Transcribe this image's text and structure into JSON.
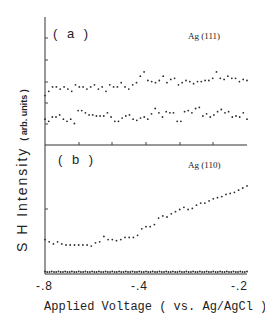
{
  "chart_data": [
    {
      "panel": "(a)",
      "annotation": "Ag (111)",
      "type": "scatter",
      "xlabel": "Applied Voltage ( vs. Ag/AgCl )",
      "ylabel": "SH Intensity ( arb. units )",
      "xlim": [
        -0.8,
        -0.2
      ],
      "x_ticks": [
        -0.8,
        -0.4,
        -0.2
      ],
      "series": [
        {
          "name": "upper",
          "x": [
            -0.8,
            -0.79,
            -0.78,
            -0.77,
            -0.76,
            -0.75,
            -0.74,
            -0.73,
            -0.72,
            -0.71,
            -0.7,
            -0.69,
            -0.68,
            -0.67,
            -0.66,
            -0.65,
            -0.64,
            -0.63,
            -0.62,
            -0.61,
            -0.6,
            -0.59,
            -0.58,
            -0.57,
            -0.56,
            -0.55,
            -0.54,
            -0.53,
            -0.52,
            -0.51,
            -0.5,
            -0.49,
            -0.48,
            -0.47,
            -0.46,
            -0.45,
            -0.44,
            -0.43,
            -0.42,
            -0.41,
            -0.4,
            -0.39,
            -0.38,
            -0.37,
            -0.36,
            -0.35,
            -0.34,
            -0.33,
            -0.32,
            -0.31,
            -0.3,
            -0.29,
            -0.28,
            -0.27,
            -0.26,
            -0.25,
            -0.24,
            -0.23,
            -0.22,
            -0.21,
            -0.2
          ],
          "y": [
            2.3,
            2.5,
            2.7,
            2.7,
            2.6,
            2.7,
            2.6,
            2.5,
            2.8,
            2.7,
            2.7,
            2.6,
            2.7,
            2.8,
            2.6,
            2.7,
            2.5,
            2.8,
            2.7,
            2.7,
            2.9,
            2.7,
            2.6,
            2.8,
            2.9,
            3.2,
            3.4,
            3.0,
            2.95,
            2.9,
            3.0,
            3.2,
            2.9,
            3.05,
            3.1,
            2.8,
            2.9,
            3.0,
            2.95,
            2.85,
            2.95,
            2.95,
            3.0,
            3.0,
            3.1,
            3.4,
            3.1,
            3.05,
            3.2,
            3.1,
            3.1,
            2.95,
            3.05,
            3.0
          ]
        },
        {
          "name": "lower",
          "x": [
            -0.8,
            -0.79,
            -0.78,
            -0.77,
            -0.76,
            -0.75,
            -0.74,
            -0.73,
            -0.72,
            -0.71,
            -0.7,
            -0.69,
            -0.68,
            -0.67,
            -0.66,
            -0.65,
            -0.64,
            -0.63,
            -0.62,
            -0.61,
            -0.6,
            -0.59,
            -0.58,
            -0.57,
            -0.56,
            -0.55,
            -0.54,
            -0.53,
            -0.52,
            -0.51,
            -0.5,
            -0.49,
            -0.48,
            -0.47,
            -0.46,
            -0.45,
            -0.44,
            -0.43,
            -0.42,
            -0.41,
            -0.4,
            -0.39,
            -0.38,
            -0.37,
            -0.36,
            -0.35,
            -0.34,
            -0.33,
            -0.32,
            -0.31,
            -0.3,
            -0.29,
            -0.28,
            -0.27,
            -0.26,
            -0.25,
            -0.24,
            -0.23,
            -0.22,
            -0.21,
            -0.2
          ],
          "y": [
            1.2,
            1.1,
            1.3,
            1.3,
            1.4,
            1.2,
            1.1,
            1.2,
            1.0,
            1.6,
            1.6,
            1.5,
            1.4,
            1.4,
            1.35,
            1.35,
            1.35,
            1.5,
            1.3,
            1.1,
            1.1,
            1.25,
            1.35,
            1.4,
            1.2,
            1.15,
            1.25,
            1.3,
            1.2,
            1.45,
            1.7,
            1.5,
            1.3,
            1.55,
            1.5,
            1.5,
            1.1,
            1.1,
            1.55,
            1.6,
            1.5,
            1.7,
            1.75,
            1.35,
            1.45,
            1.3,
            1.4,
            1.55,
            1.65,
            1.5,
            1.55,
            1.3,
            1.35,
            1.3,
            1.5,
            1.2
          ]
        }
      ]
    },
    {
      "panel": "(b)",
      "annotation": "Ag (110)",
      "type": "scatter",
      "xlabel": "Applied Voltage ( vs. Ag/AgCl )",
      "ylabel": "SH Intensity ( arb. units )",
      "xlim": [
        -0.8,
        -0.2
      ],
      "x_ticks": [
        -0.8,
        -0.4,
        -0.2
      ],
      "series": [
        {
          "name": "rising",
          "x": [
            -0.8,
            -0.79,
            -0.78,
            -0.77,
            -0.76,
            -0.75,
            -0.74,
            -0.73,
            -0.72,
            -0.71,
            -0.7,
            -0.69,
            -0.68,
            -0.67,
            -0.66,
            -0.65,
            -0.64,
            -0.63,
            -0.62,
            -0.61,
            -0.6,
            -0.59,
            -0.58,
            -0.57,
            -0.56,
            -0.55,
            -0.54,
            -0.53,
            -0.52,
            -0.51,
            -0.5,
            -0.49,
            -0.48,
            -0.47,
            -0.46,
            -0.45,
            -0.44,
            -0.43,
            -0.42,
            -0.41,
            -0.4,
            -0.39,
            -0.38,
            -0.37,
            -0.36,
            -0.35,
            -0.34,
            -0.33,
            -0.32,
            -0.31,
            -0.3,
            -0.29,
            -0.28,
            -0.27,
            -0.26,
            -0.25,
            -0.24,
            -0.23,
            -0.22,
            -0.21,
            -0.2
          ],
          "y": [
            1.6,
            1.5,
            1.4,
            1.5,
            1.4,
            1.35,
            1.35,
            1.35,
            1.35,
            1.35,
            1.35,
            1.3,
            1.45,
            1.5,
            1.75,
            1.6,
            1.6,
            1.55,
            1.6,
            1.7,
            1.7,
            1.7,
            1.8,
            2.1,
            2.2,
            2.2,
            2.3,
            2.6,
            2.7,
            2.65,
            2.8,
            2.9,
            3.0,
            3.1,
            3.0,
            3.05,
            3.2,
            3.3,
            3.3,
            3.4,
            3.5,
            3.55,
            3.6,
            3.7,
            3.75,
            3.8,
            3.9,
            4.0,
            4.1
          ]
        },
        {
          "name": "baseline",
          "description": "flat near zero across full range",
          "x": [
            -0.8,
            -0.2
          ],
          "y": [
            0.05,
            0.05
          ]
        }
      ]
    }
  ],
  "labels": {
    "panel_a": "( a )",
    "panel_b": "( b )",
    "crystal_a": "Ag (111)",
    "crystal_b": "Ag (110)",
    "x_ticks": [
      "-.8",
      "-.4",
      "-.2"
    ],
    "xlabel": "Applied Voltage ( vs. Ag/AgCl )",
    "ylabel_main": "S H  Intensity",
    "ylabel_units": "( arb. units )"
  },
  "colors": {
    "ink": "#2a2a2a",
    "background": "#ffffff"
  }
}
